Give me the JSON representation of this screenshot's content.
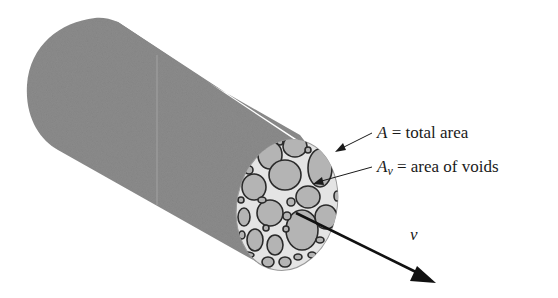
{
  "figure": {
    "type": "porous-media-cylinder",
    "colors": {
      "cylinder_body": "#8c8c8c",
      "end_face_matrix": "#e4e4e4",
      "particle_fill": "#b4b4b4",
      "particle_stroke": "#2a2a2a",
      "arrow": "#111111",
      "text": "#1a1a1a"
    }
  },
  "labels": {
    "total_area": {
      "symbol": "A",
      "text": " = total area"
    },
    "void_area": {
      "symbol": "A",
      "subscript": "v",
      "text": " = area of voids"
    },
    "velocity": {
      "symbol": "v"
    }
  }
}
